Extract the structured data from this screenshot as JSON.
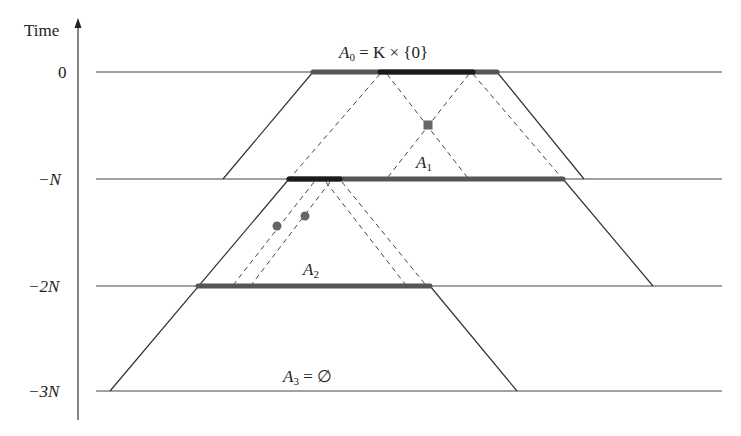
{
  "axis": {
    "label": "Time",
    "ticks": [
      {
        "label": "0",
        "y": 72
      },
      {
        "label": "−N",
        "y": 179
      },
      {
        "label": "−2N",
        "y": 286
      },
      {
        "label": "−3N",
        "y": 391
      }
    ]
  },
  "sets": [
    {
      "name": "A",
      "index": "0",
      "suffix": " = K × {0}"
    },
    {
      "name": "A",
      "index": "1",
      "suffix": ""
    },
    {
      "name": "A",
      "index": "2",
      "suffix": ""
    },
    {
      "name": "A",
      "index": "3",
      "suffix": " = ∅"
    }
  ],
  "colors": {
    "line": "#333333",
    "segment": "#555555",
    "segment_dark": "#1a1a1a",
    "marker": "#666666"
  }
}
